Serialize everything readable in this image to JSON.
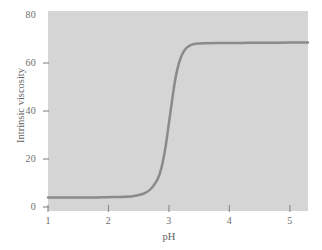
{
  "chart_data": {
    "type": "line",
    "title": "",
    "subtitle": "",
    "xlabel": "pH",
    "ylabel": "Intrinsic viscosity",
    "xlim": [
      1,
      5.3
    ],
    "ylim": [
      0,
      80
    ],
    "xticks": [
      "1",
      "2",
      "3",
      "4",
      "5"
    ],
    "xtick_values": [
      1,
      2,
      3,
      4,
      5
    ],
    "yticks": [
      "0",
      "20",
      "40",
      "60",
      "80"
    ],
    "ytick_values": [
      0,
      20,
      40,
      60,
      80
    ],
    "grid": false,
    "legend": null,
    "annotations": [],
    "series": [
      {
        "name": "Intrinsic viscosity vs pH",
        "color": "#8a8a8a",
        "line_width": 2.5,
        "marker": "none",
        "description": "Sigmoidal transition: low plateau near 4 below pH 2.5, sharp rise centered at pH ~3.05, high plateau near 68 above pH 3.5",
        "x": [
          1.0,
          1.2,
          1.4,
          1.6,
          1.8,
          2.0,
          2.2,
          2.4,
          2.5,
          2.6,
          2.7,
          2.8,
          2.85,
          2.9,
          2.95,
          3.0,
          3.05,
          3.1,
          3.15,
          3.2,
          3.25,
          3.3,
          3.35,
          3.4,
          3.5,
          3.6,
          3.8,
          4.0,
          4.3,
          4.6,
          5.0,
          5.3
        ],
        "y": [
          4.0,
          4.0,
          4.0,
          4.0,
          4.0,
          4.1,
          4.2,
          4.5,
          5.0,
          5.8,
          7.5,
          11.0,
          14.0,
          19.0,
          26.0,
          35.0,
          44.0,
          52.5,
          58.5,
          62.5,
          65.0,
          66.5,
          67.3,
          67.8,
          68.1,
          68.2,
          68.3,
          68.3,
          68.4,
          68.4,
          68.5,
          68.5
        ]
      }
    ],
    "colors": {
      "plot_background": "#d5d5d5",
      "figure_background": "#ffffff",
      "curve": "#8a8a8a",
      "tick_mark": "#8f8f8f",
      "tick_text": "#6e6e6e",
      "axis_title_text": "#5f5f5f"
    },
    "geometry": {
      "plot_left": 48,
      "plot_right": 308,
      "plot_top": 11,
      "plot_bottom": 211,
      "y_pixel_at_0": 207,
      "y_pixel_at_80": 15
    }
  }
}
